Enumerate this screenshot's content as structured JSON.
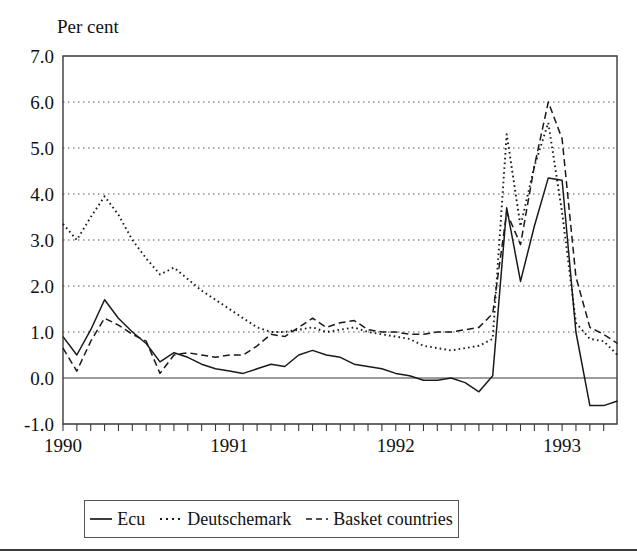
{
  "figure": {
    "y_axis_title": "Per cent",
    "bottom_rule": true
  },
  "legend": {
    "items": [
      {
        "label": "Ecu",
        "style": "solid",
        "swatch_name": "legend-swatch-solid"
      },
      {
        "label": "Deutschemark",
        "style": "dotted",
        "swatch_name": "legend-swatch-dotted"
      },
      {
        "label": "Basket countries",
        "style": "dashed",
        "swatch_name": "legend-swatch-dashed"
      }
    ]
  },
  "chart_data": {
    "type": "line",
    "title": "",
    "subtitle": "",
    "xlabel": "",
    "ylabel": "Per cent",
    "ylim": [
      -1.0,
      7.0
    ],
    "xlim": [
      1990.0,
      1993.33
    ],
    "y_ticks": [
      7.0,
      6.0,
      5.0,
      4.0,
      3.0,
      2.0,
      1.0,
      0.0,
      -1.0
    ],
    "y_tick_labels": [
      "7.0",
      "6.0",
      "5.0",
      "4.0",
      "3.0",
      "2.0",
      "1.0",
      "0.0",
      "-1.0"
    ],
    "x_ticks": [
      1990,
      1991,
      1992,
      1993
    ],
    "x_tick_labels": [
      "1990",
      "1991",
      "1992",
      "1993"
    ],
    "x_minor_tick_interval_months": 1,
    "grid": "horizontal-dotted",
    "zero_line": true,
    "legend_position": "below-plot",
    "x": [
      1990.0,
      1990.083,
      1990.167,
      1990.25,
      1990.333,
      1990.417,
      1990.5,
      1990.583,
      1990.667,
      1990.75,
      1990.833,
      1990.917,
      1991.0,
      1991.083,
      1991.167,
      1991.25,
      1991.333,
      1991.417,
      1991.5,
      1991.583,
      1991.667,
      1991.75,
      1991.833,
      1991.917,
      1992.0,
      1992.083,
      1992.167,
      1992.25,
      1992.333,
      1992.417,
      1992.5,
      1992.583,
      1992.667,
      1992.75,
      1992.833,
      1992.917,
      1993.0,
      1993.083,
      1993.167,
      1993.25,
      1993.333
    ],
    "series": [
      {
        "name": "Ecu",
        "style": "solid",
        "values": [
          0.9,
          0.5,
          1.05,
          1.7,
          1.3,
          1.0,
          0.75,
          0.35,
          0.55,
          0.45,
          0.3,
          0.2,
          0.15,
          0.1,
          0.2,
          0.3,
          0.25,
          0.5,
          0.6,
          0.5,
          0.45,
          0.3,
          0.25,
          0.2,
          0.1,
          0.05,
          -0.05,
          -0.05,
          0.0,
          -0.1,
          -0.3,
          0.05,
          3.7,
          2.1,
          3.3,
          4.35,
          4.3,
          1.0,
          -0.6,
          -0.6,
          -0.5
        ]
      },
      {
        "name": "Deutschemark",
        "style": "dotted",
        "values": [
          3.35,
          3.0,
          3.5,
          3.95,
          3.55,
          3.0,
          2.6,
          2.25,
          2.4,
          2.15,
          1.9,
          1.7,
          1.5,
          1.3,
          1.1,
          1.0,
          1.0,
          1.05,
          1.1,
          1.0,
          1.05,
          1.1,
          1.0,
          0.95,
          0.9,
          0.85,
          0.7,
          0.65,
          0.6,
          0.65,
          0.7,
          0.85,
          5.3,
          3.3,
          4.6,
          5.55,
          3.6,
          1.2,
          0.85,
          0.8,
          0.5
        ]
      },
      {
        "name": "Basket countries",
        "style": "dashed",
        "values": [
          0.65,
          0.15,
          0.8,
          1.3,
          1.15,
          0.95,
          0.8,
          0.1,
          0.5,
          0.55,
          0.5,
          0.45,
          0.5,
          0.5,
          0.7,
          0.95,
          0.9,
          1.1,
          1.3,
          1.1,
          1.2,
          1.25,
          1.05,
          1.0,
          1.0,
          0.95,
          0.95,
          1.0,
          1.0,
          1.05,
          1.1,
          1.4,
          3.6,
          2.9,
          4.6,
          6.0,
          5.2,
          2.2,
          1.1,
          0.95,
          0.75
        ]
      }
    ]
  },
  "plot_geometry": {
    "left": 63,
    "right": 617,
    "top": 56,
    "bottom": 424
  }
}
